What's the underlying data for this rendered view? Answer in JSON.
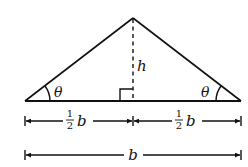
{
  "diagram": {
    "type": "isosceles-triangle",
    "labels": {
      "height": "h",
      "left_angle": "θ",
      "right_angle": "θ",
      "half_base_left_num": "1",
      "half_base_left_den": "2",
      "half_base_left_var": "b",
      "half_base_right_num": "1",
      "half_base_right_den": "2",
      "half_base_right_var": "b",
      "base": "b"
    },
    "colors": {
      "stroke": "#111111",
      "background": "#ffffff"
    }
  }
}
